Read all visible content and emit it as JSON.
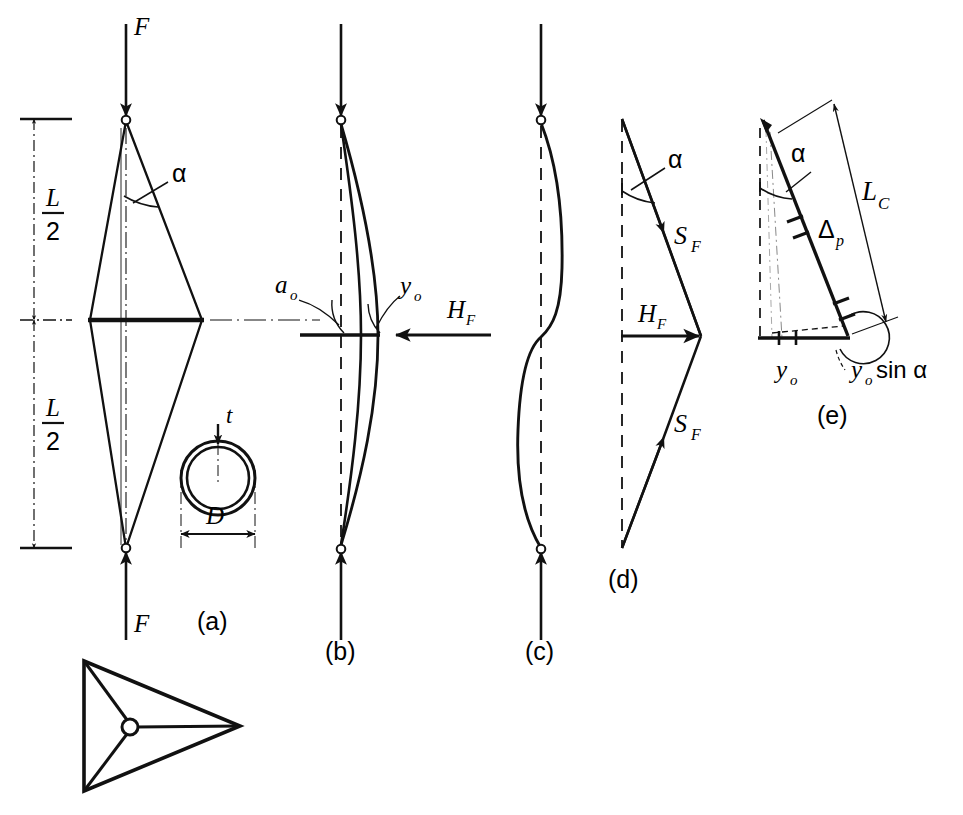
{
  "figure": {
    "background_color": "#ffffff",
    "ink_color": "#111111"
  },
  "panels": [
    {
      "id": "a",
      "caption": "(a)",
      "description": "Diamond (lenticular) strut with axial force F at both ends, half-angle alpha, length L split into two L/2 halves, plus tube cross-section detail",
      "labels": {
        "force_top": "F",
        "force_bottom": "F",
        "angle": "α",
        "half_length_upper": {
          "numerator": "L",
          "denominator": "2"
        },
        "half_length_lower": {
          "numerator": "L",
          "denominator": "2"
        },
        "wall_thickness": "t",
        "diameter": "D"
      }
    },
    {
      "id": "b",
      "caption": "(b)",
      "description": "Bowed column with initial imperfection a_o, lateral deflection y_o at midspan and applied lateral force H_F",
      "labels": {
        "initial_imperfection": "a",
        "initial_imperfection_sub": "o",
        "deflection": "y",
        "deflection_sub": "o",
        "lateral_force": "H",
        "lateral_force_sub": "F"
      }
    },
    {
      "id": "c",
      "caption": "(c)",
      "description": "Second-mode (S-shaped) buckled form of the column between the end pins"
    },
    {
      "id": "d",
      "caption": "(d)",
      "description": "Force triangle: two cable forces S_F inclined at angle alpha resolving into the horizontal force H_F",
      "labels": {
        "angle": "α",
        "cable_force_upper": "S",
        "cable_force_upper_sub": "F",
        "cable_force_lower": "S",
        "cable_force_lower_sub": "F",
        "lateral_force": "H",
        "lateral_force_sub": "F"
      }
    },
    {
      "id": "e",
      "caption": "(e)",
      "description": "Geometry of cable elongation: chord length L_C, prestress extension Delta_p, base offset y_o and its component y_o sin alpha",
      "labels": {
        "angle": "α",
        "chord_length": "L",
        "chord_length_sub": "C",
        "extension": "Δ",
        "extension_sub": "p",
        "offset": "y",
        "offset_sub": "o",
        "offset_component": "y",
        "offset_component_sub": "o",
        "offset_component_rest": "sin α"
      }
    },
    {
      "id": "f",
      "caption": "",
      "description": "End view: triangular three-spoke spreader / strut cross arrangement with central hub"
    }
  ]
}
